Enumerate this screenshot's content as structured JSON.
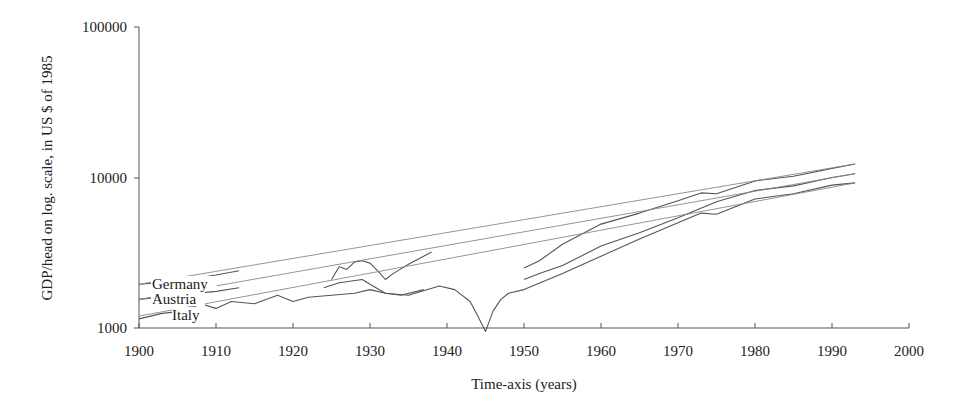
{
  "chart_data": {
    "type": "line",
    "title": "",
    "xlabel": "Time-axis (years)",
    "ylabel": "GDP/head on log. scale, in US $ of 1985",
    "yscale": "log",
    "xlim": [
      1900,
      2000
    ],
    "ylim": [
      1000,
      100000
    ],
    "x_ticks": [
      1900,
      1910,
      1920,
      1930,
      1940,
      1950,
      1960,
      1970,
      1980,
      1990,
      2000
    ],
    "x_tick_labels": [
      "1900",
      "1910",
      "1920",
      "1930",
      "1940",
      "1950",
      "1960",
      "1970",
      "1980",
      "1990",
      "2000"
    ],
    "y_ticks": [
      1000,
      10000,
      100000
    ],
    "y_tick_labels": [
      "1000",
      "10000",
      "100000"
    ],
    "grid": false,
    "legend": "inline labels at left edge",
    "annotations": [
      "Germany",
      "Austria",
      "Italy"
    ],
    "series": [
      {
        "name": "Germany",
        "kind": "actual",
        "x": [
          1900,
          1905,
          1910,
          1913,
          1925,
          1926,
          1927,
          1928,
          1929,
          1930,
          1931,
          1932,
          1933,
          1935,
          1938,
          1950,
          1952,
          1955,
          1960,
          1965,
          1970,
          1973,
          1975,
          1980,
          1985,
          1990,
          1993
        ],
        "values": [
          1950,
          2050,
          2250,
          2400,
          2100,
          2550,
          2450,
          2750,
          2800,
          2700,
          2400,
          2100,
          2300,
          2650,
          3200,
          2500,
          2800,
          3600,
          4900,
          5800,
          7000,
          7900,
          7800,
          9500,
          10200,
          11500,
          12300
        ]
      },
      {
        "name": "Austria",
        "kind": "actual",
        "x": [
          1900,
          1905,
          1910,
          1913,
          1924,
          1926,
          1929,
          1930,
          1932,
          1934,
          1937,
          1950,
          1952,
          1955,
          1960,
          1965,
          1970,
          1975,
          1980,
          1985,
          1990,
          1993
        ],
        "values": [
          1550,
          1650,
          1750,
          1850,
          1850,
          2000,
          2100,
          1950,
          1700,
          1650,
          1800,
          2100,
          2300,
          2600,
          3500,
          4300,
          5400,
          6900,
          8200,
          8800,
          10000,
          10600
        ]
      },
      {
        "name": "Italy",
        "kind": "actual",
        "x": [
          1900,
          1903,
          1906,
          1908,
          1910,
          1912,
          1915,
          1918,
          1920,
          1922,
          1925,
          1928,
          1930,
          1932,
          1935,
          1939,
          1941,
          1943,
          1944,
          1945,
          1946,
          1947,
          1948,
          1950,
          1955,
          1960,
          1965,
          1970,
          1973,
          1975,
          1980,
          1985,
          1990,
          1993
        ],
        "values": [
          1150,
          1250,
          1300,
          1450,
          1350,
          1500,
          1450,
          1650,
          1500,
          1600,
          1650,
          1700,
          1800,
          1700,
          1650,
          1900,
          1800,
          1500,
          1200,
          950,
          1300,
          1550,
          1700,
          1800,
          2300,
          3000,
          3900,
          5000,
          5800,
          5700,
          7200,
          7800,
          8900,
          9200
        ]
      },
      {
        "name": "Germany trend",
        "kind": "trend",
        "x": [
          1900,
          1993
        ],
        "values": [
          1950,
          12300
        ]
      },
      {
        "name": "Austria trend",
        "kind": "trend",
        "x": [
          1900,
          1993
        ],
        "values": [
          1550,
          10600
        ]
      },
      {
        "name": "Italy trend",
        "kind": "trend",
        "x": [
          1900,
          1993
        ],
        "values": [
          1200,
          9200
        ]
      }
    ]
  },
  "axes": {
    "xlabel": "Time-axis (years)",
    "ylabel": "GDP/head on log. scale, in US $ of 1985"
  },
  "labels": {
    "germany": "Germany",
    "austria": "Austria",
    "italy": "Italy"
  },
  "colors": {
    "axis": "#555555",
    "line": "#555555",
    "trend": "#888888",
    "text": "#222222"
  }
}
